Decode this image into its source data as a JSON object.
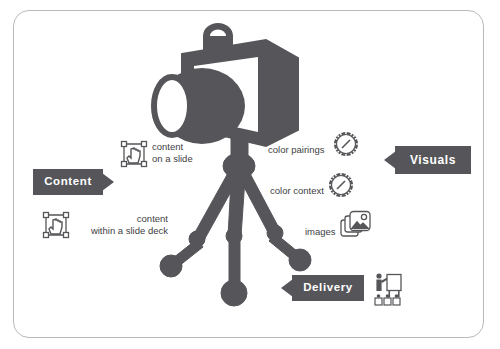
{
  "diagram": {
    "frame_border_color": "#b9b9bb",
    "accent_color": "#56565a",
    "text_color": "#3e3e42",
    "background_color": "#ffffff"
  },
  "central_graphic": {
    "name": "camera-on-tripod",
    "description": "Dark grey camera mounted on a three-legged tripod",
    "color": "#56565a"
  },
  "badges": [
    {
      "id": "content",
      "label": "Content",
      "arrow": "right",
      "color": "#56565a"
    },
    {
      "id": "visuals",
      "label": "Visuals",
      "arrow": "left",
      "color": "#56565a"
    },
    {
      "id": "delivery",
      "label": "Delivery",
      "arrow": "left",
      "color": "#56565a"
    }
  ],
  "labels": {
    "content_on_slide": {
      "line1": "content",
      "line2": "on a slide",
      "icon": "select-cursor-icon"
    },
    "content_slide_deck": {
      "line1": "content",
      "line2": "within a slide deck",
      "icon": "select-cursor-icon"
    },
    "color_pairings": {
      "line1": "color pairings",
      "icon": "color-wheel-icon"
    },
    "color_context": {
      "line1": "color context",
      "icon": "color-wheel-icon"
    },
    "images": {
      "line1": "images",
      "icon": "images-icon"
    },
    "delivery_figure": {
      "icon": "presenter-flipchart-icon"
    }
  },
  "icons": {
    "select_cursor": "select-cursor-icon",
    "color_wheel": "color-wheel-icon",
    "images": "images-icon",
    "presenter": "presenter-flipchart-icon",
    "camera": "camera-icon",
    "tripod": "tripod-icon"
  }
}
